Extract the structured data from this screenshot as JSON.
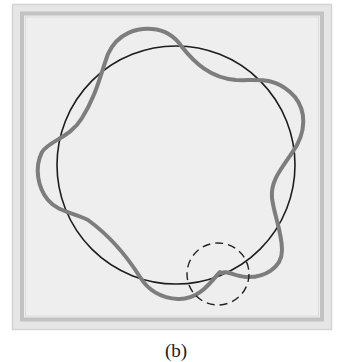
{
  "figure": {
    "caption": "(b)",
    "frame": {
      "outer_color": "#d9d9d9",
      "band_color": "#c4c4c4",
      "fill_color": "#ececec"
    },
    "reference_circle": {
      "name": "circular orbit",
      "cx": 176,
      "cy": 165,
      "r": 119,
      "stroke": "#1e1e1e",
      "stroke_width": 1.6
    },
    "wave": {
      "name": "wave around orbit (non-closing)",
      "stroke": "#7d7d7d",
      "stroke_width": 4,
      "path": "M 220 272 C 212 280, 200 300, 178 299 C 160 298, 148 290, 140 277 C 128 258, 110 236, 88 220 C 72 212, 58 212, 48 200 C 38 188, 34 168, 42 152 C 50 140, 70 138, 82 118 C 96 96, 100 76, 108 54 C 118 32, 138 28, 152 29 C 166 30, 176 38, 182 47 C 194 62, 210 78, 236 80 C 256 81, 272 76, 290 92 C 304 104, 308 124, 297 145 C 286 164, 270 178, 272 198 C 274 215, 282 232, 282 250 C 282 268, 264 278, 246 277 C 234 276, 226 270, 222 273"
    },
    "highlight_circle": {
      "name": "mismatch highlight",
      "cx": 218,
      "cy": 274,
      "r": 31,
      "stroke": "#222222",
      "dash": "8 5"
    }
  }
}
